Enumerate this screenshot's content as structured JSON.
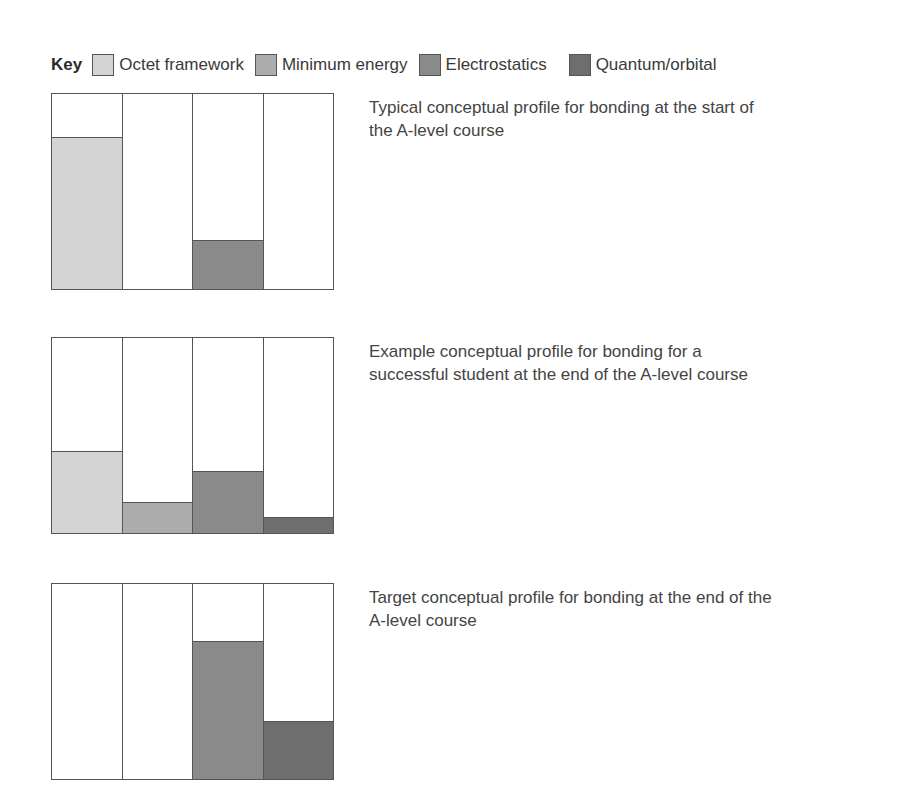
{
  "key": {
    "title": "Key",
    "items": [
      {
        "label": "Octet framework",
        "color": "#d4d4d4"
      },
      {
        "label": "Minimum energy",
        "color": "#acacac"
      },
      {
        "label": "Electrostatics",
        "color": "#8a8a8a"
      },
      {
        "label": "Quantum/orbital",
        "color": "#6e6e6e"
      }
    ]
  },
  "profiles": [
    {
      "caption": "Typical conceptual profile for bonding at the start of the A-level course",
      "values": [
        78,
        0,
        25,
        0
      ]
    },
    {
      "caption": "Example conceptual profile for bonding for a successful student at the end of the A-level course",
      "values": [
        42,
        16,
        32,
        8
      ]
    },
    {
      "caption": "Target conceptual profile for bonding at the end of the A-level course",
      "values": [
        0,
        0,
        71,
        30
      ]
    }
  ],
  "chart_data": [
    {
      "type": "bar",
      "title": "Typical conceptual profile for bonding at the start of the A-level course",
      "categories": [
        "Octet framework",
        "Minimum energy",
        "Electrostatics",
        "Quantum/orbital"
      ],
      "values": [
        78,
        0,
        25,
        0
      ],
      "xlabel": "",
      "ylabel": "",
      "ylim": [
        0,
        100
      ],
      "grid": false,
      "legend_position": "top"
    },
    {
      "type": "bar",
      "title": "Example conceptual profile for bonding for a successful student at the end of the A-level course",
      "categories": [
        "Octet framework",
        "Minimum energy",
        "Electrostatics",
        "Quantum/orbital"
      ],
      "values": [
        42,
        16,
        32,
        8
      ],
      "xlabel": "",
      "ylabel": "",
      "ylim": [
        0,
        100
      ],
      "grid": false,
      "legend_position": "top"
    },
    {
      "type": "bar",
      "title": "Target conceptual profile for bonding at the end of the A-level course",
      "categories": [
        "Octet framework",
        "Minimum energy",
        "Electrostatics",
        "Quantum/orbital"
      ],
      "values": [
        0,
        0,
        71,
        30
      ],
      "xlabel": "",
      "ylabel": "",
      "ylim": [
        0,
        100
      ],
      "grid": false,
      "legend_position": "top"
    }
  ]
}
